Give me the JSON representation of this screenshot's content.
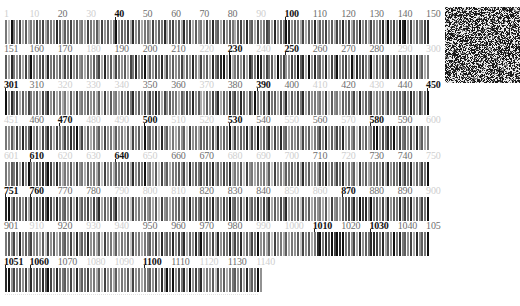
{
  "figure": {
    "origin_x": 5,
    "position_step_px": 2.833,
    "row_top_start": 8,
    "row_stride_px": 35.4,
    "label_styles": {
      "bold": "#111111",
      "normal": "#6e6e6e",
      "faint": "#cfcfcf"
    },
    "intensity_scale": "0 = white ... 9 = black",
    "rows": [
      {
        "start": 1,
        "labels": [
          {
            "pos": 1,
            "text": "1",
            "style": "faint"
          },
          {
            "pos": 10,
            "text": "10",
            "style": "faint"
          },
          {
            "pos": 20,
            "text": "20",
            "style": "normal"
          },
          {
            "pos": 30,
            "text": "30",
            "style": "faint"
          },
          {
            "pos": 40,
            "text": "40",
            "style": "bold"
          },
          {
            "pos": 50,
            "text": "50",
            "style": "normal"
          },
          {
            "pos": 60,
            "text": "60",
            "style": "normal"
          },
          {
            "pos": 70,
            "text": "70",
            "style": "normal"
          },
          {
            "pos": 80,
            "text": "80",
            "style": "normal"
          },
          {
            "pos": 90,
            "text": "90",
            "style": "faint"
          },
          {
            "pos": 100,
            "text": "100",
            "style": "bold"
          },
          {
            "pos": 110,
            "text": "110",
            "style": "normal"
          },
          {
            "pos": 120,
            "text": "120",
            "style": "normal"
          },
          {
            "pos": 130,
            "text": "130",
            "style": "normal"
          },
          {
            "pos": 140,
            "text": "140",
            "style": "normal"
          },
          {
            "pos": 150,
            "text": "150",
            "style": "normal"
          }
        ],
        "intensities": "529547363547573654863657464537546374635946573846355374658367463857364537485637465367485637457638465984653736483657463758473658463754683957498947364578"
      },
      {
        "start": 151,
        "labels": [
          {
            "pos": 151,
            "text": "151",
            "style": "normal"
          },
          {
            "pos": 160,
            "text": "160",
            "style": "normal"
          },
          {
            "pos": 170,
            "text": "170",
            "style": "normal"
          },
          {
            "pos": 180,
            "text": "180",
            "style": "faint"
          },
          {
            "pos": 190,
            "text": "190",
            "style": "normal"
          },
          {
            "pos": 200,
            "text": "200",
            "style": "normal"
          },
          {
            "pos": 210,
            "text": "210",
            "style": "normal"
          },
          {
            "pos": 220,
            "text": "220",
            "style": "faint"
          },
          {
            "pos": 230,
            "text": "230",
            "style": "bold"
          },
          {
            "pos": 240,
            "text": "240",
            "style": "faint"
          },
          {
            "pos": 250,
            "text": "250",
            "style": "bold"
          },
          {
            "pos": 260,
            "text": "260",
            "style": "normal"
          },
          {
            "pos": 270,
            "text": "270",
            "style": "normal"
          },
          {
            "pos": 280,
            "text": "280",
            "style": "normal"
          },
          {
            "pos": 290,
            "text": "290",
            "style": "faint"
          },
          {
            "pos": 300,
            "text": "300",
            "style": "faint"
          }
        ],
        "intensities": "638546374954673856463758464536465738463754637584693647583746457364853746385789493564738659847563957447596839485648375946749386754936475837484657384635"
      },
      {
        "start": 301,
        "labels": [
          {
            "pos": 301,
            "text": "301",
            "style": "bold"
          },
          {
            "pos": 310,
            "text": "310",
            "style": "normal"
          },
          {
            "pos": 320,
            "text": "320",
            "style": "faint"
          },
          {
            "pos": 330,
            "text": "330",
            "style": "faint"
          },
          {
            "pos": 340,
            "text": "340",
            "style": "faint"
          },
          {
            "pos": 350,
            "text": "350",
            "style": "normal"
          },
          {
            "pos": 360,
            "text": "360",
            "style": "normal"
          },
          {
            "pos": 370,
            "text": "370",
            "style": "faint"
          },
          {
            "pos": 380,
            "text": "380",
            "style": "normal"
          },
          {
            "pos": 390,
            "text": "390",
            "style": "bold"
          },
          {
            "pos": 400,
            "text": "400",
            "style": "normal"
          },
          {
            "pos": 410,
            "text": "410",
            "style": "faint"
          },
          {
            "pos": 420,
            "text": "420",
            "style": "normal"
          },
          {
            "pos": 430,
            "text": "430",
            "style": "faint"
          },
          {
            "pos": 440,
            "text": "440",
            "style": "normal"
          },
          {
            "pos": 450,
            "text": "450",
            "style": "bold"
          }
        ],
        "intensities": "948573647546375846353526374546453627364536475846374758637465536475846336475836485748637495473856374836475836454537264536564738465735463746565748637459"
      },
      {
        "start": 451,
        "labels": [
          {
            "pos": 451,
            "text": "451",
            "style": "faint"
          },
          {
            "pos": 460,
            "text": "460",
            "style": "normal"
          },
          {
            "pos": 470,
            "text": "470",
            "style": "bold"
          },
          {
            "pos": 480,
            "text": "480",
            "style": "faint"
          },
          {
            "pos": 490,
            "text": "490",
            "style": "faint"
          },
          {
            "pos": 500,
            "text": "500",
            "style": "bold"
          },
          {
            "pos": 510,
            "text": "510",
            "style": "faint"
          },
          {
            "pos": 520,
            "text": "520",
            "style": "faint"
          },
          {
            "pos": 530,
            "text": "530",
            "style": "bold"
          },
          {
            "pos": 540,
            "text": "540",
            "style": "normal"
          },
          {
            "pos": 550,
            "text": "550",
            "style": "faint"
          },
          {
            "pos": 560,
            "text": "560",
            "style": "normal"
          },
          {
            "pos": 570,
            "text": "570",
            "style": "faint"
          },
          {
            "pos": 580,
            "text": "580",
            "style": "bold"
          },
          {
            "pos": 590,
            "text": "590",
            "style": "normal"
          },
          {
            "pos": 600,
            "text": "600",
            "style": "faint"
          }
        ],
        "intensities": "546374856946375863754758694736354637453645362746395647384635354627453656473846593746583749465837485635463746355748364758354627463589475869475647384635"
      },
      {
        "start": 601,
        "labels": [
          {
            "pos": 601,
            "text": "601",
            "style": "faint"
          },
          {
            "pos": 610,
            "text": "610",
            "style": "bold"
          },
          {
            "pos": 620,
            "text": "620",
            "style": "faint"
          },
          {
            "pos": 630,
            "text": "630",
            "style": "faint"
          },
          {
            "pos": 640,
            "text": "640",
            "style": "bold"
          },
          {
            "pos": 650,
            "text": "650",
            "style": "faint"
          },
          {
            "pos": 660,
            "text": "660",
            "style": "normal"
          },
          {
            "pos": 670,
            "text": "670",
            "style": "normal"
          },
          {
            "pos": 680,
            "text": "680",
            "style": "faint"
          },
          {
            "pos": 690,
            "text": "690",
            "style": "faint"
          },
          {
            "pos": 700,
            "text": "700",
            "style": "faint"
          },
          {
            "pos": 710,
            "text": "710",
            "style": "normal"
          },
          {
            "pos": 720,
            "text": "720",
            "style": "faint"
          },
          {
            "pos": 730,
            "text": "730",
            "style": "normal"
          },
          {
            "pos": 740,
            "text": "740",
            "style": "normal"
          },
          {
            "pos": 750,
            "text": "750",
            "style": "faint"
          }
        ],
        "intensities": "546573849547586974853546374536453627453656473846594536274635564738465747583647583546274535453627453656473846354758364758354627463556473846584758364759"
      },
      {
        "start": 751,
        "labels": [
          {
            "pos": 751,
            "text": "751",
            "style": "bold"
          },
          {
            "pos": 760,
            "text": "760",
            "style": "bold"
          },
          {
            "pos": 770,
            "text": "770",
            "style": "normal"
          },
          {
            "pos": 780,
            "text": "780",
            "style": "normal"
          },
          {
            "pos": 790,
            "text": "790",
            "style": "faint"
          },
          {
            "pos": 800,
            "text": "800",
            "style": "faint"
          },
          {
            "pos": 810,
            "text": "810",
            "style": "faint"
          },
          {
            "pos": 820,
            "text": "820",
            "style": "normal"
          },
          {
            "pos": 830,
            "text": "830",
            "style": "normal"
          },
          {
            "pos": 840,
            "text": "840",
            "style": "normal"
          },
          {
            "pos": 850,
            "text": "850",
            "style": "faint"
          },
          {
            "pos": 860,
            "text": "860",
            "style": "faint"
          },
          {
            "pos": 870,
            "text": "870",
            "style": "bold"
          },
          {
            "pos": 880,
            "text": "880",
            "style": "normal"
          },
          {
            "pos": 890,
            "text": "890",
            "style": "normal"
          },
          {
            "pos": 900,
            "text": "900",
            "style": "faint"
          }
        ],
        "intensities": "894756473847586974855647384657475836475835462745364536274535564738465747583647595647384658475836475835462746354536274536675849784956473846584758364759"
      },
      {
        "start": 901,
        "labels": [
          {
            "pos": 901,
            "text": "901",
            "style": "normal"
          },
          {
            "pos": 910,
            "text": "910",
            "style": "faint"
          },
          {
            "pos": 920,
            "text": "920",
            "style": "normal"
          },
          {
            "pos": 930,
            "text": "930",
            "style": "faint"
          },
          {
            "pos": 940,
            "text": "940",
            "style": "faint"
          },
          {
            "pos": 950,
            "text": "950",
            "style": "normal"
          },
          {
            "pos": 960,
            "text": "960",
            "style": "normal"
          },
          {
            "pos": 970,
            "text": "970",
            "style": "normal"
          },
          {
            "pos": 980,
            "text": "980",
            "style": "normal"
          },
          {
            "pos": 990,
            "text": "990",
            "style": "faint"
          },
          {
            "pos": 1000,
            "text": "1000",
            "style": "faint"
          },
          {
            "pos": 1010,
            "text": "1010",
            "style": "bold"
          },
          {
            "pos": 1020,
            "text": "1020",
            "style": "normal"
          },
          {
            "pos": 1030,
            "text": "1030",
            "style": "bold"
          },
          {
            "pos": 1040,
            "text": "1040",
            "style": "normal"
          },
          {
            "pos": 1050,
            "text": "105",
            "style": "normal"
          }
        ],
        "intensities": "564738465745362746355647384658453627453635462745355647384658475836485956473846584758364759453627453635462746358958697989564738465887583649585647384659"
      },
      {
        "start": 1051,
        "labels": [
          {
            "pos": 1051,
            "text": "1051",
            "style": "bold"
          },
          {
            "pos": 1060,
            "text": "1060",
            "style": "bold"
          },
          {
            "pos": 1070,
            "text": "1070",
            "style": "normal"
          },
          {
            "pos": 1080,
            "text": "1080",
            "style": "faint"
          },
          {
            "pos": 1090,
            "text": "1090",
            "style": "faint"
          },
          {
            "pos": 1100,
            "text": "1100",
            "style": "bold"
          },
          {
            "pos": 1110,
            "text": "1110",
            "style": "normal"
          },
          {
            "pos": 1120,
            "text": "1120",
            "style": "faint"
          },
          {
            "pos": 1130,
            "text": "1130",
            "style": "normal"
          },
          {
            "pos": 1140,
            "text": "1140",
            "style": "faint"
          }
        ],
        "intensities": "8947564738475869748556473846574536274536354627453556473849594758394758354627463556473846594"
      }
    ],
    "noise_image": {
      "name": "noise-texture-thumbnail",
      "width": 75,
      "height": 76,
      "seed": 7
    }
  }
}
